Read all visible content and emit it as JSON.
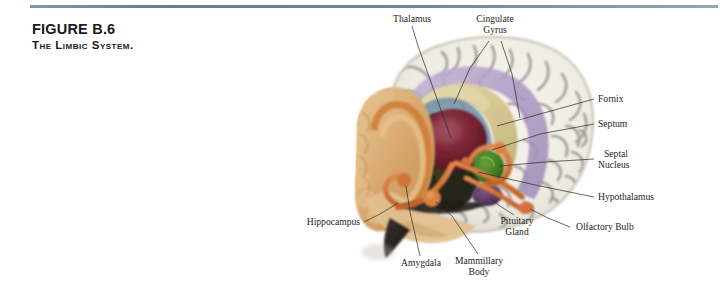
{
  "figure": {
    "number": "FIGURE B.6",
    "title": "The Limbic System.",
    "rule_color": "#6e8b97"
  },
  "illustration": {
    "kind": "anatomical-illustration",
    "subject": "midsagittal human brain showing limbic system structures",
    "palette": {
      "cortex_light": "#efece4",
      "cortex_sulci": "#8d8a84",
      "cingulate_gyrus": "#b2a0c8",
      "fornix": "#d8cc9a",
      "ventricle_blue": "#6f8fa8",
      "thalamus": "#7d2535",
      "hippocampus_tan": "#d9a86f",
      "hippocampus_orange": "#d2762f",
      "septal_nucleus": "#3f7a22",
      "vessels_coral": "#d4703c",
      "pituitary_violet": "#5a3a60",
      "brainstem_dark": "#2b2422"
    }
  },
  "labels": [
    {
      "id": "thalamus",
      "text": "Thalamus",
      "lines": [
        "Thalamus"
      ]
    },
    {
      "id": "cingulate",
      "text": "Cingulate Gyrus",
      "lines": [
        "Cingulate",
        "Gyrus"
      ]
    },
    {
      "id": "fornix",
      "text": "Fornix",
      "lines": [
        "Fornix"
      ]
    },
    {
      "id": "septum",
      "text": "Septum",
      "lines": [
        "Septum"
      ]
    },
    {
      "id": "septal-nucleus",
      "text": "Septal Nucleus",
      "lines": [
        "Septal",
        "Nucleus"
      ]
    },
    {
      "id": "hypothalamus",
      "text": "Hypothalamus",
      "lines": [
        "Hypothalamus"
      ]
    },
    {
      "id": "olfactory-bulb",
      "text": "Olfactory Bulb",
      "lines": [
        "Olfactory Bulb"
      ]
    },
    {
      "id": "pituitary",
      "text": "Pituitary Gland",
      "lines": [
        "Pituitary",
        "Gland"
      ]
    },
    {
      "id": "mammillary",
      "text": "Mammillary Body",
      "lines": [
        "Mammillary",
        "Body"
      ]
    },
    {
      "id": "amygdala",
      "text": "Amygdala",
      "lines": [
        "Amygdala"
      ]
    },
    {
      "id": "hippocampus",
      "text": "Hippocampus",
      "lines": [
        "Hippocampus"
      ]
    }
  ]
}
